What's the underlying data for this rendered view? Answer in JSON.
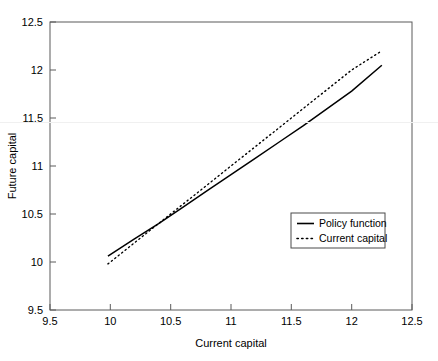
{
  "chart_data": {
    "type": "line",
    "title": "",
    "xlabel": "Current capital",
    "ylabel": "Future capital",
    "xlim": [
      9.5,
      12.5
    ],
    "ylim": [
      9.5,
      12.5
    ],
    "xticks": [
      "9.5",
      "10",
      "10.5",
      "11",
      "11.5",
      "12",
      "12.5"
    ],
    "xtick_values": [
      9.5,
      10,
      10.5,
      11,
      11.5,
      12,
      12.5
    ],
    "yticks": [
      "9.5",
      "10",
      "10.5",
      "11",
      "11.5",
      "12",
      "12.5"
    ],
    "ytick_values": [
      9.5,
      10,
      10.5,
      11,
      11.5,
      12,
      12.5
    ],
    "grid": false,
    "legend_position": "lower right",
    "series": [
      {
        "name": "Policy function",
        "style": "solid",
        "color": "#000000",
        "x": [
          9.98,
          10.2,
          10.4,
          10.6,
          10.8,
          11.0,
          11.2,
          11.4,
          11.6,
          11.8,
          12.0,
          12.25
        ],
        "y": [
          10.06,
          10.24,
          10.4,
          10.57,
          10.74,
          10.91,
          11.08,
          11.25,
          11.42,
          11.6,
          11.78,
          12.05
        ]
      },
      {
        "name": "Current capital",
        "style": "dotted",
        "color": "#000000",
        "x": [
          9.98,
          10.2,
          10.4,
          10.6,
          10.8,
          11.0,
          11.2,
          11.4,
          11.6,
          11.8,
          12.0,
          12.25
        ],
        "y": [
          9.98,
          10.2,
          10.4,
          10.6,
          10.8,
          11.0,
          11.2,
          11.4,
          11.6,
          11.8,
          12.0,
          12.2
        ]
      }
    ]
  },
  "legend": {
    "entries": [
      {
        "label": "Policy function",
        "style": "solid"
      },
      {
        "label": "Current capital",
        "style": "dotted"
      }
    ]
  }
}
